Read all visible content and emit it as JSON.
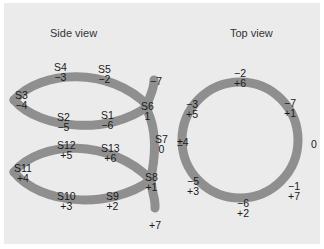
{
  "side_view": {
    "title": "Side view",
    "stroke_color": "#8f8f8f",
    "upper_loop": [
      {
        "name": "S4",
        "value": "−3"
      },
      {
        "name": "S5",
        "value": "−2"
      },
      {
        "name": "S3",
        "value": "−4"
      },
      {
        "name": "S2",
        "value": "−5"
      },
      {
        "name": "S1",
        "value": "−6"
      },
      {
        "name": "S6",
        "value": "1"
      }
    ],
    "lower_loop": [
      {
        "name": "S12",
        "value": "+5"
      },
      {
        "name": "S13",
        "value": "+6"
      },
      {
        "name": "S11",
        "value": "+4"
      },
      {
        "name": "S10",
        "value": "+3"
      },
      {
        "name": "S9",
        "value": "+2"
      },
      {
        "name": "S8",
        "value": "+1"
      }
    ],
    "stem": {
      "top_value": "−7",
      "middle": {
        "name": "S7",
        "value": "0"
      },
      "bottom_value": "+7"
    }
  },
  "top_view": {
    "title": "Top view",
    "stroke_color": "#8f8f8f",
    "labels": [
      {
        "top": "−2",
        "bottom": "+6"
      },
      {
        "top": "−3",
        "bottom": "+5"
      },
      {
        "top": "−7",
        "bottom": "+1"
      },
      {
        "top": "±4",
        "bottom": ""
      },
      {
        "top": "0",
        "bottom": ""
      },
      {
        "top": "−5",
        "bottom": "+3"
      },
      {
        "top": "−1",
        "bottom": "+7"
      },
      {
        "top": "−6",
        "bottom": "+2"
      }
    ]
  }
}
